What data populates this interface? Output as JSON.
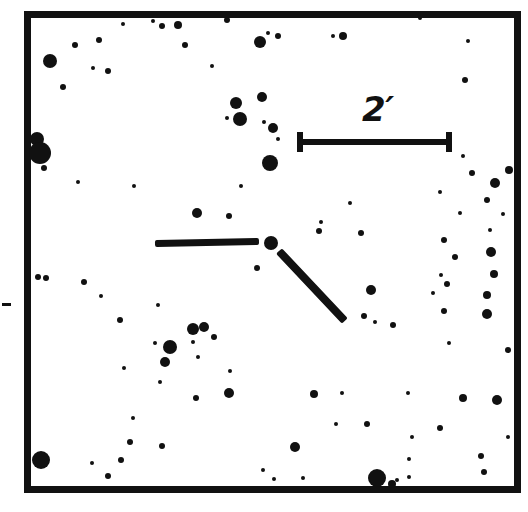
{
  "figure": {
    "kind": "astronomical-finding-chart",
    "background_color": "#ffffff",
    "ink_color": "#111111",
    "width": 528,
    "height": 512
  },
  "frame": {
    "label": "chart-border",
    "x": 24,
    "y": 11,
    "width": 497,
    "height": 482,
    "border_width": 7,
    "color": "#111111"
  },
  "scalebar": {
    "label": "2'",
    "label_text": "2′",
    "value": 2,
    "unit": "arcmin",
    "x1": 297,
    "x2": 452,
    "y": 142,
    "thickness": 6,
    "cap_height": 20,
    "cap_width": 6,
    "label_x": 362,
    "label_y": 92,
    "label_size": 34
  },
  "target_marker": {
    "label": "target-indicator",
    "description": "pair of bars pointing at target object",
    "bars": [
      {
        "name": "horizontal-bar",
        "x1": 155,
        "y1": 243,
        "x2": 259,
        "y2": 241,
        "thickness": 7
      },
      {
        "name": "diagonal-bar",
        "x1": 279,
        "y1": 251,
        "x2": 345,
        "y2": 321,
        "thickness": 8
      }
    ],
    "target_star": {
      "cx": 271,
      "cy": 243,
      "r": 7
    }
  },
  "edge_tick": {
    "label": "left-edge-tick",
    "x": 2,
    "y": 303,
    "width": 9,
    "height": 3
  },
  "chart_data": {
    "type": "scatter",
    "title": "",
    "subtitle": "",
    "xlabel": "",
    "ylabel": "",
    "grid": false,
    "legend": null,
    "annotations": [
      {
        "text": "2′",
        "x": 380,
        "y": 113,
        "role": "scale-bar-label"
      }
    ],
    "xlim": [
      24,
      521
    ],
    "ylim": [
      11,
      493
    ],
    "point_radius_unit": "px",
    "points": [
      {
        "cx": 50,
        "cy": 61,
        "r": 7
      },
      {
        "cx": 99,
        "cy": 40,
        "r": 3
      },
      {
        "cx": 75,
        "cy": 45,
        "r": 3
      },
      {
        "cx": 108,
        "cy": 71,
        "r": 3
      },
      {
        "cx": 178,
        "cy": 25,
        "r": 4
      },
      {
        "cx": 93,
        "cy": 68,
        "r": 2
      },
      {
        "cx": 63,
        "cy": 87,
        "r": 3
      },
      {
        "cx": 123,
        "cy": 24,
        "r": 2
      },
      {
        "cx": 153,
        "cy": 21,
        "r": 2
      },
      {
        "cx": 162,
        "cy": 26,
        "r": 3
      },
      {
        "cx": 185,
        "cy": 45,
        "r": 3
      },
      {
        "cx": 236,
        "cy": 103,
        "r": 6
      },
      {
        "cx": 262,
        "cy": 97,
        "r": 5
      },
      {
        "cx": 227,
        "cy": 20,
        "r": 3
      },
      {
        "cx": 212,
        "cy": 66,
        "r": 2
      },
      {
        "cx": 260,
        "cy": 42,
        "r": 6
      },
      {
        "cx": 278,
        "cy": 36,
        "r": 3
      },
      {
        "cx": 333,
        "cy": 36,
        "r": 2
      },
      {
        "cx": 343,
        "cy": 36,
        "r": 4
      },
      {
        "cx": 264,
        "cy": 122,
        "r": 2
      },
      {
        "cx": 240,
        "cy": 119,
        "r": 7
      },
      {
        "cx": 227,
        "cy": 118,
        "r": 2
      },
      {
        "cx": 273,
        "cy": 128,
        "r": 5
      },
      {
        "cx": 278,
        "cy": 139,
        "r": 2
      },
      {
        "cx": 465,
        "cy": 80,
        "r": 3
      },
      {
        "cx": 468,
        "cy": 41,
        "r": 2
      },
      {
        "cx": 420,
        "cy": 18,
        "r": 2
      },
      {
        "cx": 270,
        "cy": 163,
        "r": 8
      },
      {
        "cx": 37,
        "cy": 139,
        "r": 7
      },
      {
        "cx": 40,
        "cy": 153,
        "r": 11
      },
      {
        "cx": 44,
        "cy": 168,
        "r": 3
      },
      {
        "cx": 268,
        "cy": 33,
        "r": 2
      },
      {
        "cx": 495,
        "cy": 183,
        "r": 5
      },
      {
        "cx": 509,
        "cy": 170,
        "r": 4
      },
      {
        "cx": 463,
        "cy": 156,
        "r": 2
      },
      {
        "cx": 472,
        "cy": 173,
        "r": 3
      },
      {
        "cx": 487,
        "cy": 200,
        "r": 3
      },
      {
        "cx": 503,
        "cy": 214,
        "r": 2
      },
      {
        "cx": 440,
        "cy": 192,
        "r": 2
      },
      {
        "cx": 460,
        "cy": 213,
        "r": 2
      },
      {
        "cx": 197,
        "cy": 213,
        "r": 5
      },
      {
        "cx": 134,
        "cy": 186,
        "r": 2
      },
      {
        "cx": 229,
        "cy": 216,
        "r": 3
      },
      {
        "cx": 200,
        "cy": 244,
        "r": 2
      },
      {
        "cx": 319,
        "cy": 231,
        "r": 3
      },
      {
        "cx": 321,
        "cy": 222,
        "r": 2
      },
      {
        "cx": 361,
        "cy": 233,
        "r": 3
      },
      {
        "cx": 490,
        "cy": 230,
        "r": 2
      },
      {
        "cx": 444,
        "cy": 240,
        "r": 3
      },
      {
        "cx": 455,
        "cy": 257,
        "r": 3
      },
      {
        "cx": 491,
        "cy": 252,
        "r": 5
      },
      {
        "cx": 46,
        "cy": 278,
        "r": 3
      },
      {
        "cx": 101,
        "cy": 296,
        "r": 2
      },
      {
        "cx": 120,
        "cy": 320,
        "r": 3
      },
      {
        "cx": 158,
        "cy": 305,
        "r": 2
      },
      {
        "cx": 371,
        "cy": 290,
        "r": 5
      },
      {
        "cx": 364,
        "cy": 316,
        "r": 3
      },
      {
        "cx": 375,
        "cy": 322,
        "r": 2
      },
      {
        "cx": 441,
        "cy": 275,
        "r": 2
      },
      {
        "cx": 447,
        "cy": 284,
        "r": 3
      },
      {
        "cx": 433,
        "cy": 293,
        "r": 2
      },
      {
        "cx": 494,
        "cy": 274,
        "r": 4
      },
      {
        "cx": 487,
        "cy": 295,
        "r": 4
      },
      {
        "cx": 444,
        "cy": 311,
        "r": 3
      },
      {
        "cx": 487,
        "cy": 314,
        "r": 5
      },
      {
        "cx": 393,
        "cy": 325,
        "r": 3
      },
      {
        "cx": 193,
        "cy": 329,
        "r": 6
      },
      {
        "cx": 204,
        "cy": 327,
        "r": 5
      },
      {
        "cx": 214,
        "cy": 337,
        "r": 3
      },
      {
        "cx": 84,
        "cy": 282,
        "r": 3
      },
      {
        "cx": 38,
        "cy": 277,
        "r": 3
      },
      {
        "cx": 257,
        "cy": 268,
        "r": 3
      },
      {
        "cx": 170,
        "cy": 347,
        "r": 7
      },
      {
        "cx": 193,
        "cy": 342,
        "r": 2
      },
      {
        "cx": 155,
        "cy": 343,
        "r": 2
      },
      {
        "cx": 165,
        "cy": 362,
        "r": 5
      },
      {
        "cx": 124,
        "cy": 368,
        "r": 2
      },
      {
        "cx": 198,
        "cy": 357,
        "r": 2
      },
      {
        "cx": 230,
        "cy": 371,
        "r": 2
      },
      {
        "cx": 196,
        "cy": 398,
        "r": 3
      },
      {
        "cx": 314,
        "cy": 394,
        "r": 4
      },
      {
        "cx": 342,
        "cy": 393,
        "r": 2
      },
      {
        "cx": 440,
        "cy": 428,
        "r": 3
      },
      {
        "cx": 408,
        "cy": 393,
        "r": 2
      },
      {
        "cx": 463,
        "cy": 398,
        "r": 4
      },
      {
        "cx": 497,
        "cy": 400,
        "r": 5
      },
      {
        "cx": 336,
        "cy": 424,
        "r": 2
      },
      {
        "cx": 367,
        "cy": 424,
        "r": 3
      },
      {
        "cx": 412,
        "cy": 437,
        "r": 2
      },
      {
        "cx": 295,
        "cy": 447,
        "r": 5
      },
      {
        "cx": 481,
        "cy": 456,
        "r": 3
      },
      {
        "cx": 484,
        "cy": 472,
        "r": 3
      },
      {
        "cx": 409,
        "cy": 459,
        "r": 2
      },
      {
        "cx": 409,
        "cy": 477,
        "r": 2
      },
      {
        "cx": 130,
        "cy": 442,
        "r": 3
      },
      {
        "cx": 162,
        "cy": 446,
        "r": 3
      },
      {
        "cx": 41,
        "cy": 460,
        "r": 9
      },
      {
        "cx": 121,
        "cy": 460,
        "r": 3
      },
      {
        "cx": 108,
        "cy": 476,
        "r": 3
      },
      {
        "cx": 92,
        "cy": 463,
        "r": 2
      },
      {
        "cx": 133,
        "cy": 418,
        "r": 2
      },
      {
        "cx": 263,
        "cy": 470,
        "r": 2
      },
      {
        "cx": 377,
        "cy": 478,
        "r": 9
      },
      {
        "cx": 392,
        "cy": 484,
        "r": 4
      },
      {
        "cx": 397,
        "cy": 480,
        "r": 2
      },
      {
        "cx": 303,
        "cy": 478,
        "r": 2
      },
      {
        "cx": 160,
        "cy": 382,
        "r": 2
      },
      {
        "cx": 229,
        "cy": 393,
        "r": 5
      },
      {
        "cx": 274,
        "cy": 479,
        "r": 2
      },
      {
        "cx": 449,
        "cy": 343,
        "r": 2
      },
      {
        "cx": 508,
        "cy": 350,
        "r": 3
      },
      {
        "cx": 508,
        "cy": 437,
        "r": 2
      },
      {
        "cx": 78,
        "cy": 182,
        "r": 2
      },
      {
        "cx": 241,
        "cy": 186,
        "r": 2
      },
      {
        "cx": 350,
        "cy": 203,
        "r": 2
      }
    ]
  }
}
